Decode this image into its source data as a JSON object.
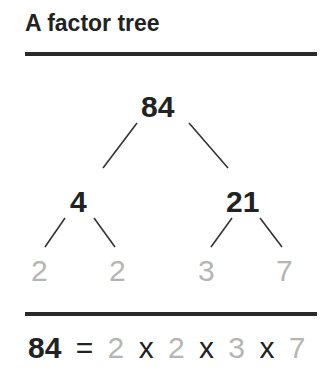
{
  "title": "A factor tree",
  "tree": {
    "root": "84",
    "level1": [
      "4",
      "21"
    ],
    "level2": [
      "2",
      "2",
      "3",
      "7"
    ]
  },
  "equation": {
    "lhs": "84",
    "equals": "=",
    "factors": [
      "2",
      "2",
      "3",
      "7"
    ],
    "times": "x"
  },
  "colors": {
    "composite": "#222222",
    "prime": "#b5b5b5",
    "rule": "#2a2a2a"
  }
}
